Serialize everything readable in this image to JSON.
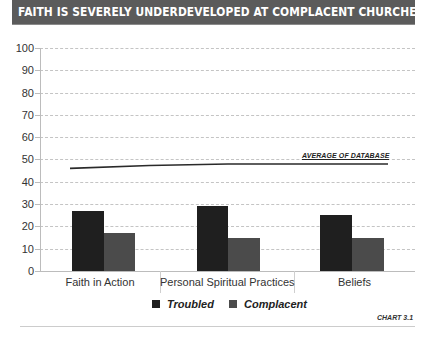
{
  "header": {
    "title": "FAITH IS SEVERELY UNDERDEVELOPED AT COMPLACENT CHURCHES"
  },
  "colors": {
    "header_bg": "#5b5b5b",
    "troubled": "#1f1f1f",
    "complacent": "#4b4b4b",
    "grid": "#c4c4c4"
  },
  "axis": {
    "y_ticks": [
      "100",
      "90",
      "80",
      "70",
      "60",
      "50",
      "40",
      "30",
      "20",
      "10",
      "0"
    ]
  },
  "categories": [
    "Faith in Action",
    "Personal Spiritual Practices",
    "Beliefs"
  ],
  "average_label": "AVERAGE OF DATABASE",
  "legend": {
    "troubled": "Troubled",
    "complacent": "Complacent"
  },
  "chart_id": "CHART 3.1",
  "chart_data": {
    "type": "bar",
    "title": "FAITH IS SEVERELY UNDERDEVELOPED AT COMPLACENT CHURCHES",
    "categories": [
      "Faith in Action",
      "Personal Spiritual Practices",
      "Beliefs"
    ],
    "series": [
      {
        "name": "Troubled",
        "values": [
          27,
          29,
          25
        ],
        "color": "#1f1f1f"
      },
      {
        "name": "Complacent",
        "values": [
          17,
          15,
          15
        ],
        "color": "#4b4b4b"
      }
    ],
    "reference_line": {
      "name": "AVERAGE OF DATABASE",
      "type": "line",
      "values": [
        46,
        48,
        48
      ]
    },
    "xlabel": "",
    "ylabel": "",
    "ylim": [
      0,
      100
    ],
    "yticks": [
      0,
      10,
      20,
      30,
      40,
      50,
      60,
      70,
      80,
      90,
      100
    ],
    "grid": true,
    "legend_position": "bottom",
    "annotation": "CHART 3.1"
  }
}
